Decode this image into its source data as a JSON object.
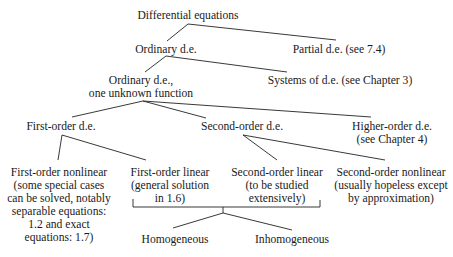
{
  "diagram": {
    "type": "tree",
    "nodes": {
      "root": "Differential equations",
      "ordinary": "Ordinary d.e.",
      "partial": "Partial d.e. (see 7.4)",
      "one_unknown_l1": "Ordinary d.e.,",
      "one_unknown_l2": "one unknown function",
      "systems": "Systems of d.e. (see Chapter 3)",
      "first_order": "First-order d.e.",
      "second_order": "Second-order d.e.",
      "higher_order_l1": "Higher-order d.e.",
      "higher_order_l2": "(see Chapter 4)",
      "first_nonlinear": [
        "First-order nonlinear",
        "(some special cases",
        "can be solved, notably",
        "separable equations:",
        "1.2 and exact",
        "equations: 1.7)"
      ],
      "first_linear": [
        "First-order linear",
        "(general solution",
        "in 1.6)"
      ],
      "second_linear": [
        "Second-order linear",
        "(to be studied",
        "extensively)"
      ],
      "second_nonlinear": [
        "Second-order nonlinear",
        "(usually hopeless except",
        "by approximation)"
      ],
      "homogeneous": "Homogeneous",
      "inhomogeneous": "Inhomogeneous"
    },
    "edges": [
      [
        "Differential equations",
        "Ordinary d.e."
      ],
      [
        "Differential equations",
        "Partial d.e. (see 7.4)"
      ],
      [
        "Ordinary d.e.",
        "Ordinary d.e., one unknown function"
      ],
      [
        "Ordinary d.e.",
        "Systems of d.e. (see Chapter 3)"
      ],
      [
        "Ordinary d.e., one unknown function",
        "First-order d.e."
      ],
      [
        "Ordinary d.e., one unknown function",
        "Second-order d.e."
      ],
      [
        "Ordinary d.e., one unknown function",
        "Higher-order d.e. (see Chapter 4)"
      ],
      [
        "First-order d.e.",
        "First-order nonlinear"
      ],
      [
        "First-order d.e.",
        "First-order linear"
      ],
      [
        "Second-order d.e.",
        "Second-order linear"
      ],
      [
        "Second-order d.e.",
        "Second-order nonlinear"
      ],
      [
        "First-order linear + Second-order linear",
        "Homogeneous"
      ],
      [
        "First-order linear + Second-order linear",
        "Inhomogeneous"
      ]
    ]
  }
}
